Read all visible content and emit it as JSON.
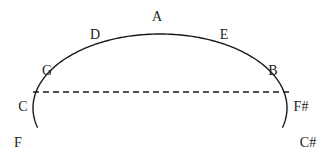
{
  "diagram": {
    "background_color": "#ffffff",
    "stroke_color": "#1a1a1a",
    "arc": {
      "kind": "semicircle-arc",
      "cx": 160,
      "cy": 108,
      "rx": 127,
      "ry": 74,
      "start_angle_deg": 195,
      "end_angle_deg": -15,
      "stroke_width": 1.4
    },
    "dashed_line": {
      "kind": "horizontal-dashed-chord",
      "x1": 33,
      "x2": 291,
      "y": 92,
      "dash": "6 4",
      "stroke_width": 1.3
    },
    "labels": [
      {
        "id": "note-a",
        "text": "A",
        "x": 157,
        "y": 17
      },
      {
        "id": "note-d",
        "text": "D",
        "x": 95,
        "y": 35
      },
      {
        "id": "note-e",
        "text": "E",
        "x": 224,
        "y": 35
      },
      {
        "id": "note-g",
        "text": "G",
        "x": 47,
        "y": 71
      },
      {
        "id": "note-b",
        "text": "B",
        "x": 273,
        "y": 71
      },
      {
        "id": "note-c",
        "text": "C",
        "x": 23,
        "y": 107
      },
      {
        "id": "note-fsharp",
        "text": "F#",
        "x": 301,
        "y": 107
      },
      {
        "id": "note-f",
        "text": "F",
        "x": 18,
        "y": 143
      },
      {
        "id": "note-csharp",
        "text": "C#",
        "x": 308,
        "y": 143
      }
    ]
  }
}
